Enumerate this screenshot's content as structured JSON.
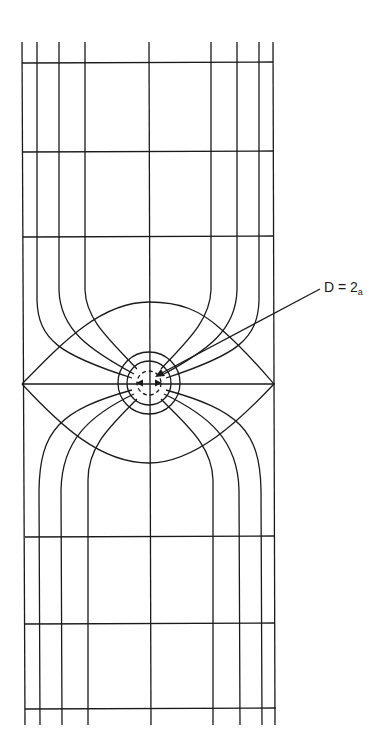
{
  "figure": {
    "type": "field-line diagram",
    "annotation": {
      "text_main": "D = 2",
      "text_subscript": "a"
    },
    "colors": {
      "line": "#1a1a1a",
      "background": "#ffffff"
    },
    "grid": {
      "vertical_lines_x_top": [
        22,
        37,
        59,
        85,
        149,
        211,
        237,
        259,
        273
      ],
      "horizontal_lines_y_top": [
        63,
        152,
        236
      ],
      "horizontal_lines_y_bottom": [
        537,
        624,
        708
      ],
      "center_axis_y": 384
    },
    "inclusion": {
      "center": [
        149,
        383
      ],
      "outer_circle_r": 31,
      "middle_circle_r": 22,
      "dashed_circle_r": 12
    },
    "lens": {
      "left_tip": [
        22,
        384
      ],
      "right_tip": [
        274,
        384
      ],
      "top": [
        149,
        302
      ],
      "bottom": [
        149,
        463
      ]
    }
  }
}
